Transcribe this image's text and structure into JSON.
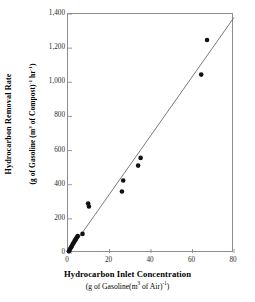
{
  "chart_data": {
    "type": "scatter",
    "title": "",
    "xlabel": "Hydrocarbon Inlet Concentration",
    "xlabel_units": "(g of Gasoline(m3 of Air)-1)",
    "ylabel": "Hydrocarbon Removal Rate",
    "ylabel_units": "(g of Gasoline (m3 of Compost)-1 hr-1)",
    "xlim": [
      0,
      80
    ],
    "ylim": [
      0,
      1400
    ],
    "xticks": [
      "0",
      "20",
      "40",
      "60",
      "80"
    ],
    "xtick_values": [
      0,
      20,
      40,
      60,
      80
    ],
    "yticks": [
      "0",
      "200",
      "400",
      "600",
      "800",
      "1,000",
      "1,200",
      "1,400"
    ],
    "ytick_values": [
      0,
      200,
      400,
      600,
      800,
      1000,
      1200,
      1400
    ],
    "grid": false,
    "legend": "none",
    "marker_color": "#111111",
    "line_color": "#6b6b6b",
    "frame_color": "#8d8d8d",
    "series": [
      {
        "name": "Measured removal rate",
        "marker": "filled-circle",
        "points": [
          [
            0.4,
            10
          ],
          [
            0.8,
            18
          ],
          [
            1.1,
            26
          ],
          [
            1.5,
            33
          ],
          [
            1.9,
            42
          ],
          [
            2.3,
            52
          ],
          [
            2.7,
            60
          ],
          [
            3.1,
            68
          ],
          [
            3.5,
            76
          ],
          [
            3.9,
            84
          ],
          [
            4.3,
            92
          ],
          [
            4.7,
            100
          ],
          [
            7.0,
            112
          ],
          [
            9.7,
            290
          ],
          [
            10.1,
            272
          ],
          [
            26.0,
            360
          ],
          [
            26.6,
            425
          ],
          [
            33.8,
            512
          ],
          [
            35.0,
            557
          ],
          [
            64.2,
            1045
          ],
          [
            67.0,
            1248
          ]
        ]
      }
    ],
    "trendline": {
      "name": "linear fit",
      "x_start": 0,
      "y_start": 0,
      "x_end": 80,
      "y_end": 1380
    }
  },
  "axis": {
    "y_title_main": "Hydrocarbon Removal Rate",
    "y_title_sub_a": "(g of Gasoline (m",
    "y_title_sub_sup1": "3",
    "y_title_sub_b": " of Compost)",
    "y_title_sub_sup2": "-1",
    "y_title_sub_c": " hr",
    "y_title_sub_sup3": "-1",
    "y_title_sub_d": ")",
    "x_title_main": "Hydrocarbon Inlet Concentration",
    "x_title_sub_a": "(g of Gasoline(m",
    "x_title_sub_sup1": "3",
    "x_title_sub_b": " of Air)",
    "x_title_sub_sup2": "-1",
    "x_title_sub_c": ")"
  }
}
